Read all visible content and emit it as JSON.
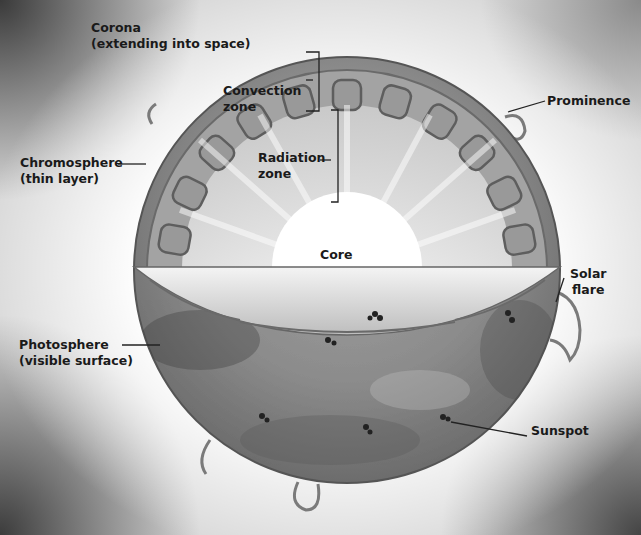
{
  "diagram": {
    "labels": {
      "corona": {
        "line1": "Corona",
        "line2": "(extending into space)"
      },
      "convection": {
        "line1": "Convection",
        "line2": "zone"
      },
      "prominence": {
        "line1": "Prominence"
      },
      "chromosphere": {
        "line1": "Chromosphere",
        "line2": "(thin layer)"
      },
      "radiation": {
        "line1": "Radiation",
        "line2": "zone"
      },
      "core": {
        "line1": "Core"
      },
      "solar_flare": {
        "line1": "Solar",
        "line2": "flare"
      },
      "photosphere": {
        "line1": "Photosphere",
        "line2": "(visible surface)"
      },
      "sunspot": {
        "line1": "Sunspot"
      }
    },
    "colors": {
      "label_text": "#1a1a1a",
      "leader_line": "#222222",
      "surface": "#8a8a8a",
      "convection_cells": "#6e6e6e",
      "radiation_zone": "#e6e6e6",
      "core": "#ffffff"
    }
  }
}
